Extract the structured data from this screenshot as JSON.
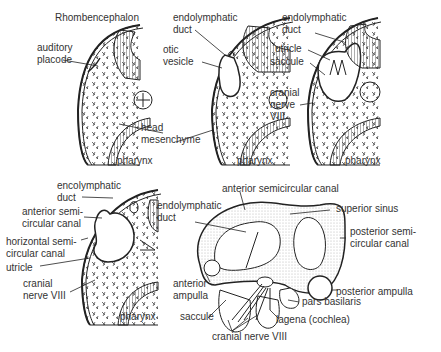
{
  "figure": {
    "panels": [
      {
        "id": "stage1",
        "labels": {
          "rhombencephalon": "Rhombencephalon",
          "auditory_placode_1": "auditory",
          "auditory_placode_2": "placode",
          "pharynx": "pharynx"
        }
      },
      {
        "id": "stage2",
        "labels": {
          "endolymphatic_1": "endolymphatic",
          "endolymphatic_2": "duct",
          "otic_1": "otic",
          "otic_2": "vesicle",
          "head_1": "head",
          "head_2": "mesenchyme",
          "pharynx": "pharynx"
        }
      },
      {
        "id": "stage3",
        "labels": {
          "endolymphatic_1": "endolymphatic",
          "endolymphatic_2": "duct",
          "utricle": "utricle",
          "saccule": "saccule",
          "cranial_1": "cranial",
          "cranial_2": "nerve",
          "cranial_3": "VIII",
          "pharynx": "pharynx"
        }
      },
      {
        "id": "stage4",
        "labels": {
          "endolymphatic_1": "encolymphatic",
          "endolymphatic_2": "duct",
          "anterior_1": "anterior semi-",
          "anterior_2": "circular canal",
          "horizontal_1": "horizontal semi-",
          "horizontal_2": "circular canal",
          "utricle": "utricle",
          "cranial_1": "cranial",
          "cranial_2": "nerve VIII",
          "pharynx": "pharynx"
        }
      },
      {
        "id": "labyrinth",
        "labels": {
          "anterior_canal": "anterior semicircular canal",
          "endolymphatic_1": "endolymphatic",
          "endolymphatic_2": "duct",
          "superior_sinus": "superior sinus",
          "posterior_canal_1": "posterior semi-",
          "posterior_canal_2": "circular canal",
          "anterior_ampulla_1": "anterior",
          "anterior_ampulla_2": "ampulla",
          "posterior_ampulla": "posterior ampulla",
          "pars_basilaris": "pars basilaris",
          "saccule": "saccule",
          "lagena": "lagena (cochlea)",
          "cranial_nerve": "cranial nerve VIII"
        }
      }
    ]
  }
}
